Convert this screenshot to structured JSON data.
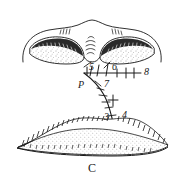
{
  "figure": {
    "caption": "C",
    "title": "",
    "background_color": "#ffffff",
    "ink_color": "#1a1a1a",
    "labels": [
      {
        "id": "label-p",
        "text": "P",
        "x": 78,
        "y": 80,
        "kind": "point"
      },
      {
        "id": "label-5",
        "text": "5",
        "x": 89,
        "y": 62,
        "kind": "number"
      },
      {
        "id": "label-6",
        "text": "6",
        "x": 112,
        "y": 62,
        "kind": "number"
      },
      {
        "id": "label-7",
        "text": "7",
        "x": 104,
        "y": 79,
        "kind": "number"
      },
      {
        "id": "label-8",
        "text": "8",
        "x": 144,
        "y": 73,
        "kind": "number"
      },
      {
        "id": "label-3",
        "text": "3",
        "x": 104,
        "y": 112,
        "kind": "number"
      },
      {
        "id": "label-4",
        "text": "4",
        "x": 122,
        "y": 110,
        "kind": "number"
      }
    ],
    "structures": [
      {
        "name": "upper-lobed-body",
        "description": "two shaded lobes with hatched margins under an arched outline"
      },
      {
        "name": "lower-ridge-body",
        "description": "stippled wave-shaped band with comb hatching along its upper edge"
      },
      {
        "name": "horizontal-axis",
        "description": "tick-marked horizontal line running right from point P to label 8"
      },
      {
        "name": "descending-branch",
        "description": "tick-marked curved line descending from point P to labels 3 and 4"
      },
      {
        "name": "radiating-lines",
        "description": "short curved strokes between the two upper lobes"
      }
    ]
  }
}
